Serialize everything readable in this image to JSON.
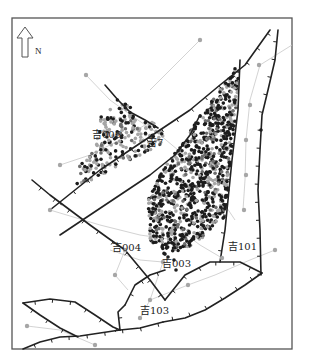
{
  "map": {
    "north_label": "N",
    "frame": {
      "x": 12,
      "y": 18,
      "w": 280,
      "h": 331
    },
    "colors": {
      "fault": "#222222",
      "network": "#c8c8c8",
      "well_gray": "#a6a6a6",
      "well_dark": "#1c1c1c",
      "frame": "#555555"
    },
    "well_labels": [
      {
        "text": "吉006",
        "x": 92,
        "y": 138
      },
      {
        "text": "吉7",
        "x": 147,
        "y": 146
      },
      {
        "text": "吉004",
        "x": 112,
        "y": 251
      },
      {
        "text": "吉003",
        "x": 162,
        "y": 267
      },
      {
        "text": "吉101",
        "x": 228,
        "y": 250
      },
      {
        "text": "吉103",
        "x": 140,
        "y": 314
      }
    ],
    "faults": [
      "M 105 85 L 118 100 L 130 112 L 145 120 L 158 128",
      "M 50 210 L 75 190 L 100 170 L 130 150 L 160 130 L 190 110 L 220 85 L 245 65 L 270 30",
      "M 60 235 L 90 215 L 120 195 L 150 175 L 175 155 L 190 135 L 200 115",
      "M 240 60 L 238 110 L 232 160 L 228 200 L 225 230 L 220 262",
      "M 278 30 L 275 60 L 268 90 L 262 115 L 260 150 L 258 190 L 260 230 L 261 275",
      "M 32 180 L 50 195 L 70 210 L 90 225 L 108 238 L 125 250 L 150 280 L 165 300",
      "M 165 300 L 185 275 L 210 262 L 240 262 L 262 273",
      "M 125 305 L 135 285 L 150 275 L 165 270",
      "M 262 273 L 245 285 L 225 298 L 205 310 L 185 318 L 163 322",
      "M 23 303 L 50 299 L 75 302 L 95 315 L 113 327 L 120 330",
      "M 23 303 L 40 315 L 60 328 L 78 337",
      "M 23 349 L 40 342 L 60 337 L 80 336 L 100 333 L 120 330 L 140 328 L 163 322",
      "M 120 330 L 118 312 L 125 305"
    ],
    "network_lines": [
      "M 86 75 L 110 100 L 135 118 L 160 135 L 190 160 L 215 190 L 235 220",
      "M 60 165 L 90 155 L 120 140 L 150 122",
      "M 50 210 L 100 225 L 140 235 L 175 240",
      "M 125 250 L 115 275 L 128 290",
      "M 140 318 L 150 300 L 163 262",
      "M 188 285 L 215 275 L 250 260 L 275 250",
      "M 200 40 L 170 70 L 150 90",
      "M 292 45 L 260 65 L 250 100 L 246 140 L 245 180 L 243 210",
      "M 27 326 L 60 330 L 95 345",
      "M 180 230 L 200 245 L 222 258",
      "M 150 300 L 188 285",
      "M 110 250 L 140 260 L 163 262"
    ],
    "sparse_wells": [
      [
        86,
        75
      ],
      [
        200,
        40
      ],
      [
        259,
        65
      ],
      [
        250,
        105
      ],
      [
        246,
        140
      ],
      [
        246,
        175
      ],
      [
        244,
        210
      ],
      [
        275,
        250
      ],
      [
        222,
        258
      ],
      [
        188,
        285
      ],
      [
        150,
        300
      ],
      [
        140,
        318
      ],
      [
        115,
        275
      ],
      [
        125,
        250
      ],
      [
        163,
        262
      ],
      [
        60,
        165
      ],
      [
        27,
        326
      ],
      [
        95,
        345
      ],
      [
        50,
        210
      ]
    ],
    "isolated_dark_wells": [
      [
        261,
        130
      ],
      [
        174,
        260
      ],
      [
        176,
        270
      ],
      [
        168,
        257
      ]
    ]
  }
}
